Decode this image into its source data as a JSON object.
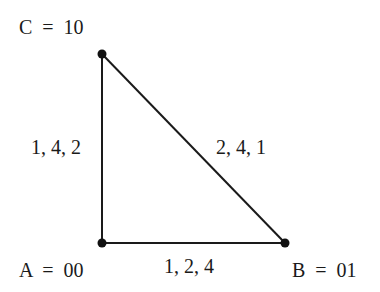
{
  "diagram": {
    "type": "triangle-graph",
    "vertices": [
      {
        "id": "C",
        "label": "C  =  10",
        "x": 102,
        "y": 54
      },
      {
        "id": "A",
        "label": "A  =  00",
        "x": 102,
        "y": 243
      },
      {
        "id": "B",
        "label": "B  =  01",
        "x": 285,
        "y": 243
      }
    ],
    "edges": [
      {
        "from": "A",
        "to": "C",
        "label": "1, 4, 2"
      },
      {
        "from": "C",
        "to": "B",
        "label": "2, 4, 1"
      },
      {
        "from": "A",
        "to": "B",
        "label": "1, 2, 4"
      }
    ],
    "colors": {
      "line": "#1a1a1a",
      "text": "#1a1a1a",
      "background": "#ffffff"
    }
  }
}
